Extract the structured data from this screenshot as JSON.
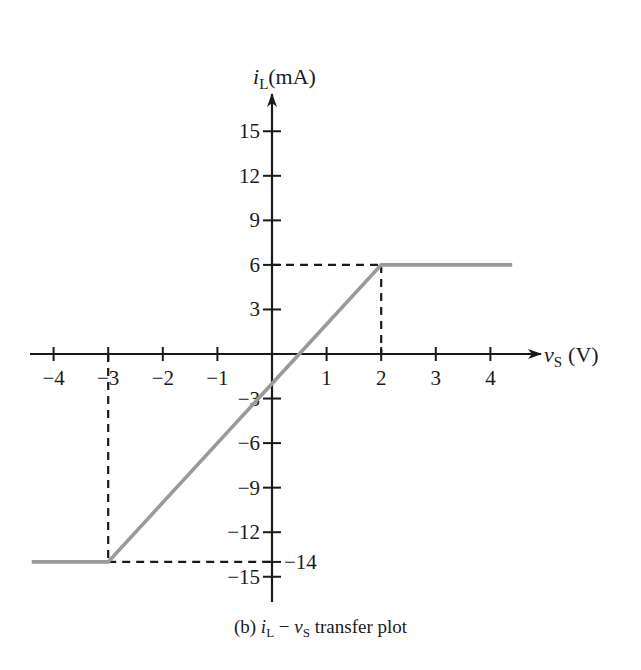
{
  "chart_data": {
    "type": "line",
    "title": "(b) iL − vs transfer plot",
    "caption_prefix": "(b)",
    "caption_suffix": "transfer plot",
    "xlabel": "vs (V)",
    "ylabel": "iL(mA)",
    "xlabel_var": "v",
    "xlabel_sub": "S",
    "xlabel_unit": "(V)",
    "ylabel_var": "i",
    "ylabel_sub": "L",
    "ylabel_unit": "(mA)",
    "xlim": [
      -4.4,
      4.4
    ],
    "ylim": [
      -16.5,
      17.5
    ],
    "x_ticks": [
      -4,
      -3,
      -2,
      -1,
      1,
      2,
      3,
      4
    ],
    "y_ticks": [
      15,
      12,
      9,
      6,
      3,
      -3,
      -6,
      -9,
      -12,
      -15
    ],
    "extra_y_tick": -14,
    "grid": false,
    "series": [
      {
        "name": "iL vs vs",
        "color": "#9a9a9a",
        "x": [
          -4.4,
          -3,
          2,
          4.4
        ],
        "y": [
          -14,
          -14,
          6,
          6
        ]
      }
    ],
    "annotations": [
      {
        "type": "dashed-guide",
        "from": [
          0,
          6
        ],
        "to": [
          2,
          6
        ]
      },
      {
        "type": "dashed-guide",
        "from": [
          2,
          6
        ],
        "to": [
          2,
          0
        ]
      },
      {
        "type": "dashed-guide",
        "from": [
          -3,
          0
        ],
        "to": [
          -3,
          -14
        ]
      },
      {
        "type": "dashed-guide",
        "from": [
          -3,
          -14
        ],
        "to": [
          0,
          -14
        ]
      },
      {
        "type": "label",
        "text": "−14",
        "at": [
          0,
          -14
        ]
      }
    ],
    "breakpoints": {
      "lower": {
        "vs": -3,
        "iL": -14
      },
      "upper": {
        "vs": 2,
        "iL": 6
      }
    },
    "slope_mA_per_V": 4,
    "y_intercept_mA": -2
  }
}
